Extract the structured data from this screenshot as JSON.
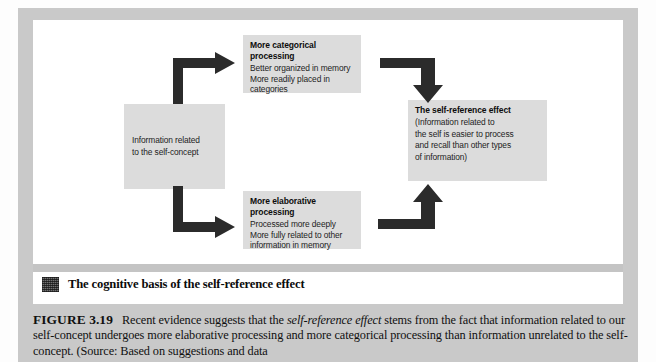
{
  "figure": {
    "micro_title": "The cognitive basis of the self-reference effect",
    "micro_title_icon": "halftone-square-icon",
    "caption": {
      "label": "FIGURE 3.19",
      "part1": "Recent evidence suggests that the ",
      "emphasis1": "self-reference effect",
      "part2": " stems from the fact that information related to our self-concept undergoes more elaborative processing and more categorical processing than information unrelated to the self-concept. (Source: Based on suggestions and data"
    }
  },
  "diagram": {
    "boxes": {
      "source": {
        "lines": [
          "Information related",
          "to the self-concept"
        ]
      },
      "categorical": {
        "header": "More categorical processing",
        "lines": [
          "Better organized in memory",
          "More readily placed in",
          "categories"
        ]
      },
      "elaborative": {
        "header": "More elaborative processing",
        "lines": [
          "Processed more deeply",
          "More fully related to other",
          "information in memory"
        ]
      },
      "effect": {
        "header": "The self-reference effect",
        "lines": [
          "(Information related to",
          "the self is easier to process",
          "and recall than other types",
          "of information)"
        ]
      }
    },
    "arrows": [
      {
        "name": "source-to-categorical",
        "shape": "elbow-up-right"
      },
      {
        "name": "source-to-elaborative",
        "shape": "elbow-down-right"
      },
      {
        "name": "categorical-to-effect",
        "shape": "elbow-right-down"
      },
      {
        "name": "elaborative-to-effect",
        "shape": "elbow-right-up"
      }
    ]
  },
  "colors": {
    "plate": "#c9c9c9",
    "panel": "#ffffff",
    "box_fill": "#dcdcdc",
    "arrow": "#2b2b2b",
    "text": "#141414"
  }
}
